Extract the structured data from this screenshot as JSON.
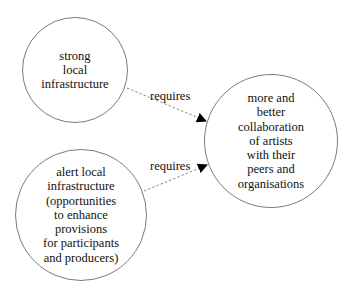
{
  "diagram": {
    "type": "concept-map",
    "nodes": [
      {
        "id": "strong-local-infrastructure",
        "label": "strong\nlocal\ninfrastructure",
        "shape": "circle",
        "center": [
          75,
          70
        ],
        "radius": 53
      },
      {
        "id": "alert-local-infrastructure",
        "label": "alert local\ninfrastructure\n(opportunities\nto enhance\nprovisions\nfor participants\nand producers)",
        "shape": "circle",
        "center": [
          81,
          215
        ],
        "radius": 66
      },
      {
        "id": "more-better-collaboration",
        "label": "more and\nbetter\ncollaboration\nof artists\nwith their\npeers and\norganisations",
        "shape": "circle",
        "center": [
          271,
          141
        ],
        "radius": 67
      }
    ],
    "edges": [
      {
        "from": "strong-local-infrastructure",
        "to": "more-better-collaboration",
        "label": "requires",
        "style": "dashed",
        "arrowhead": "filled-triangle"
      },
      {
        "from": "alert-local-infrastructure",
        "to": "more-better-collaboration",
        "label": "requires",
        "style": "dashed",
        "arrowhead": "filled-triangle"
      }
    ]
  },
  "colors": {
    "node_border": "#7a7a7a",
    "edge_line": "#8a8a8a",
    "arrowhead": "#000000",
    "text": "#111111",
    "background": "#ffffff"
  }
}
